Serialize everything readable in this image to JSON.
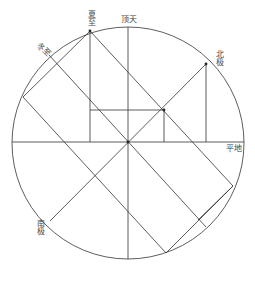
{
  "diagram": {
    "type": "astronomical-circle-construction",
    "labels": {
      "summer_solstice": "夏至",
      "zenith": "顶天",
      "winter_solstice": "冬至",
      "north_pole": "北极",
      "horizon": "平地",
      "south_pole": "南极"
    },
    "colors": {
      "stroke": "#333333",
      "text": "#444444",
      "background": "#ffffff"
    },
    "circle": {
      "cx": 128,
      "cy": 142,
      "r": 116
    }
  }
}
